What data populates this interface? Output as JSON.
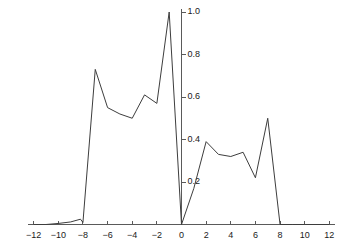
{
  "chart_data": {
    "type": "line",
    "title": "",
    "subtitle": "",
    "xlabel": "",
    "ylabel": "",
    "xlim": [
      -12,
      12
    ],
    "ylim": [
      0,
      1.0
    ],
    "grid": false,
    "legend": null,
    "legend_position": "none",
    "line_color": "#3d3d3d",
    "axis_color": "#5a5a5a",
    "background_color": "#ffffff",
    "xticks": [
      -12,
      -10,
      -8,
      -6,
      -4,
      -2,
      0,
      2,
      4,
      6,
      8,
      10,
      12
    ],
    "xtick_labels": [
      "−12",
      "−10",
      "−8",
      "−6",
      "−4",
      "−2",
      "0",
      "2",
      "4",
      "6",
      "8",
      "10",
      "12"
    ],
    "yticks": [
      0.2,
      0.4,
      0.6,
      0.8,
      1.0
    ],
    "ytick_labels": [
      "0.2",
      "0.4",
      "0.6",
      "0.8",
      "1.0"
    ],
    "x": [
      -12,
      -11,
      -10,
      -9,
      -8.2,
      -8,
      -7,
      -6,
      -5,
      -4,
      -3,
      -2,
      -1,
      0,
      1,
      2,
      3,
      4,
      5,
      6,
      7,
      8,
      9,
      10,
      11,
      12
    ],
    "values": [
      0,
      0,
      0.005,
      0.012,
      0.025,
      0.01,
      0.73,
      0.55,
      0.52,
      0.5,
      0.61,
      0.57,
      1.0,
      0,
      0.17,
      0.39,
      0.33,
      0.32,
      0.34,
      0.22,
      0.5,
      0,
      0,
      0,
      0,
      0
    ],
    "series": [
      {
        "name": "series-1",
        "values": [
          0,
          0,
          0.005,
          0.012,
          0.025,
          0.01,
          0.73,
          0.55,
          0.52,
          0.5,
          0.61,
          0.57,
          1.0,
          0,
          0.17,
          0.39,
          0.33,
          0.32,
          0.34,
          0.22,
          0.5,
          0,
          0,
          0,
          0,
          0
        ]
      }
    ]
  }
}
